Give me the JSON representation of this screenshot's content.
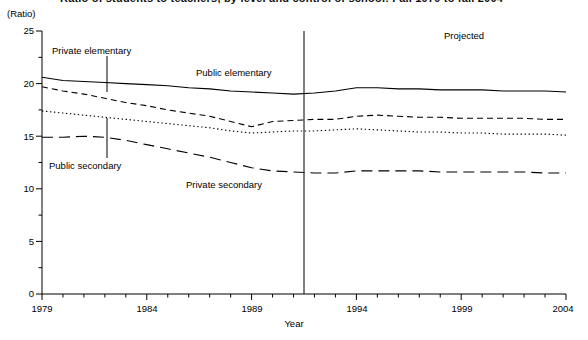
{
  "title": "Ratio of students to teachers, by level and control of school: Fall 1979 to fall 2004",
  "axis": {
    "y_unit_label": "(Ratio)",
    "x_title": "Year",
    "y_ticks": [
      "0",
      "5",
      "10",
      "15",
      "20",
      "25"
    ],
    "x_ticks": [
      "1979",
      "1984",
      "1989",
      "1994",
      "1999",
      "2004"
    ]
  },
  "annotations": {
    "projected": "Projected",
    "public_elementary": "Public elementary",
    "private_elementary": "Private elementary",
    "public_secondary": "Public secondary",
    "private_secondary": "Private secondary"
  },
  "chart_data": {
    "type": "line",
    "title": "Ratio of students to teachers, by level and control of school: Fall 1979 to fall 2004",
    "xlabel": "Year",
    "ylabel": "(Ratio)",
    "xlim": [
      1979,
      2004
    ],
    "ylim": [
      0,
      25
    ],
    "ytick_step": 5,
    "yminor_step": 2.5,
    "grid": false,
    "legend": "inline-annotations",
    "projection_divider_year": 1991.5,
    "projection_note": "Projected",
    "x": [
      1979,
      1980,
      1981,
      1982,
      1983,
      1984,
      1985,
      1986,
      1987,
      1988,
      1989,
      1990,
      1991,
      1992,
      1993,
      1994,
      1995,
      1996,
      1997,
      1998,
      1999,
      2000,
      2001,
      2002,
      2003,
      2004
    ],
    "series": [
      {
        "name": "Public elementary",
        "style": "solid",
        "values": [
          20.6,
          20.3,
          20.2,
          20.1,
          20.0,
          19.9,
          19.8,
          19.6,
          19.5,
          19.3,
          19.2,
          19.1,
          19.0,
          19.1,
          19.3,
          19.6,
          19.6,
          19.5,
          19.5,
          19.4,
          19.4,
          19.4,
          19.3,
          19.3,
          19.3,
          19.2
        ]
      },
      {
        "name": "Private elementary",
        "style": "short-dash",
        "values": [
          19.7,
          19.3,
          19.0,
          18.6,
          18.2,
          17.9,
          17.5,
          17.2,
          16.9,
          16.4,
          15.9,
          16.4,
          16.5,
          16.6,
          16.6,
          16.9,
          17.0,
          16.9,
          16.8,
          16.8,
          16.7,
          16.7,
          16.7,
          16.7,
          16.6,
          16.6
        ]
      },
      {
        "name": "Public secondary",
        "style": "dotted",
        "values": [
          17.4,
          17.2,
          17.0,
          16.8,
          16.6,
          16.4,
          16.2,
          16.0,
          15.8,
          15.5,
          15.3,
          15.4,
          15.5,
          15.5,
          15.6,
          15.7,
          15.6,
          15.5,
          15.4,
          15.4,
          15.3,
          15.3,
          15.2,
          15.2,
          15.2,
          15.1
        ]
      },
      {
        "name": "Private secondary",
        "style": "long-dash",
        "values": [
          14.9,
          14.9,
          15.0,
          14.9,
          14.6,
          14.2,
          13.8,
          13.4,
          13.0,
          12.5,
          12.0,
          11.7,
          11.6,
          11.5,
          11.5,
          11.7,
          11.7,
          11.7,
          11.7,
          11.6,
          11.6,
          11.6,
          11.6,
          11.6,
          11.5,
          11.5
        ]
      }
    ]
  }
}
